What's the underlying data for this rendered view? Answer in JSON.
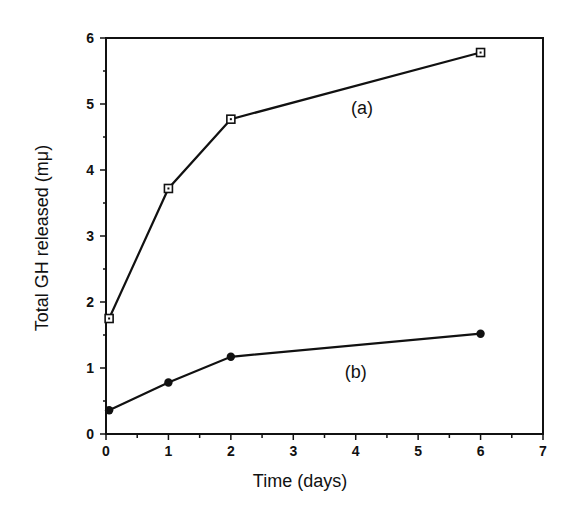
{
  "chart_data": {
    "type": "line",
    "title": "",
    "xlabel": "Time  (days)",
    "ylabel": "Total  GH  released  (mμ)",
    "xlim": [
      0,
      7
    ],
    "ylim": [
      0,
      6
    ],
    "x_ticks": [
      "0",
      "1",
      "2",
      "3",
      "4",
      "5",
      "6",
      "7"
    ],
    "y_ticks": [
      "0",
      "1",
      "2",
      "3",
      "4",
      "5",
      "6"
    ],
    "grid": false,
    "legend": "inline labels",
    "series": [
      {
        "name": "(a)",
        "marker": "open-square",
        "x": [
          0.05,
          1,
          2,
          6
        ],
        "values": [
          1.75,
          3.72,
          4.77,
          5.78
        ],
        "label_pos": [
          4.1,
          4.85
        ]
      },
      {
        "name": "(b)",
        "marker": "filled-circle",
        "x": [
          0.05,
          1,
          2,
          6
        ],
        "values": [
          0.36,
          0.78,
          1.17,
          1.52
        ],
        "label_pos": [
          4.0,
          0.85
        ]
      }
    ]
  }
}
